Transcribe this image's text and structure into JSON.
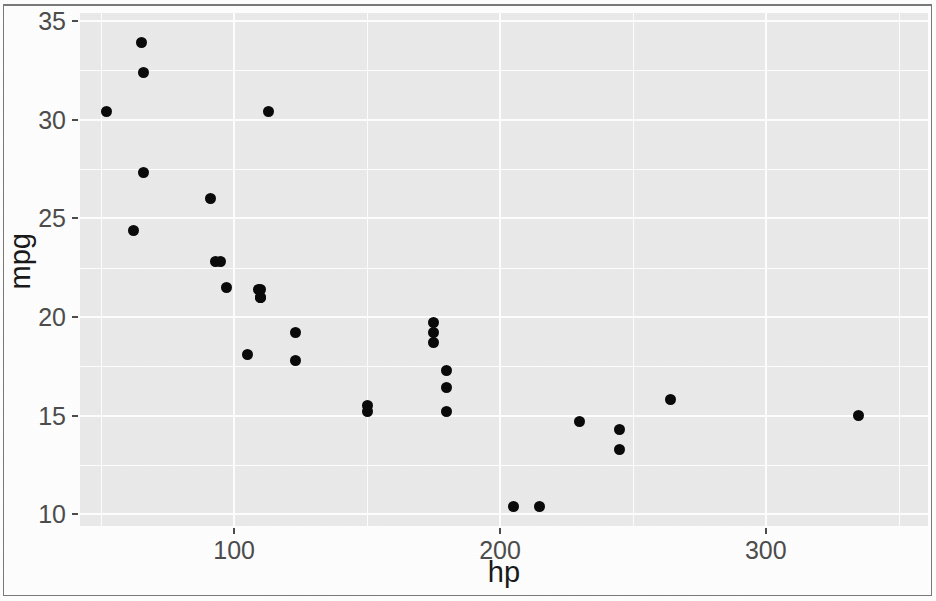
{
  "chart_data": {
    "type": "scatter",
    "title": "",
    "subtitle": "",
    "xlabel": "hp",
    "ylabel": "mpg",
    "xlim": [
      42,
      361
    ],
    "ylim": [
      9.4,
      35.4
    ],
    "x_ticks": [
      100,
      200,
      300
    ],
    "x_tick_labels": [
      "100",
      "200",
      "300"
    ],
    "y_ticks": [
      10,
      15,
      20,
      25,
      30,
      35
    ],
    "y_tick_labels": [
      "10",
      "15",
      "20",
      "25",
      "30",
      "35"
    ],
    "x_minor_ticks": [
      50,
      150,
      250,
      350
    ],
    "y_minor_ticks": [
      12.5,
      17.5,
      22.5,
      27.5,
      32.5
    ],
    "grid": true,
    "legend": "none",
    "point_color": "#0a0a0a",
    "panel_background": "#ebebeb",
    "gridline_color": "#ffffff",
    "axis_text_color": "#4d4d4d",
    "axis_title_color": "#1a1a1a",
    "x": [
      110,
      110,
      93,
      110,
      175,
      105,
      245,
      62,
      95,
      123,
      123,
      180,
      180,
      180,
      205,
      215,
      230,
      66,
      52,
      65,
      97,
      150,
      150,
      245,
      175,
      66,
      91,
      113,
      264,
      175,
      335,
      109
    ],
    "y": [
      21.0,
      21.0,
      22.8,
      21.4,
      18.7,
      18.1,
      14.3,
      24.4,
      22.8,
      19.2,
      17.8,
      16.4,
      17.3,
      15.2,
      10.4,
      10.4,
      14.7,
      32.4,
      30.4,
      33.9,
      21.5,
      15.5,
      15.2,
      13.3,
      19.2,
      27.3,
      26.0,
      30.4,
      15.8,
      19.7,
      15.0,
      21.4
    ]
  }
}
